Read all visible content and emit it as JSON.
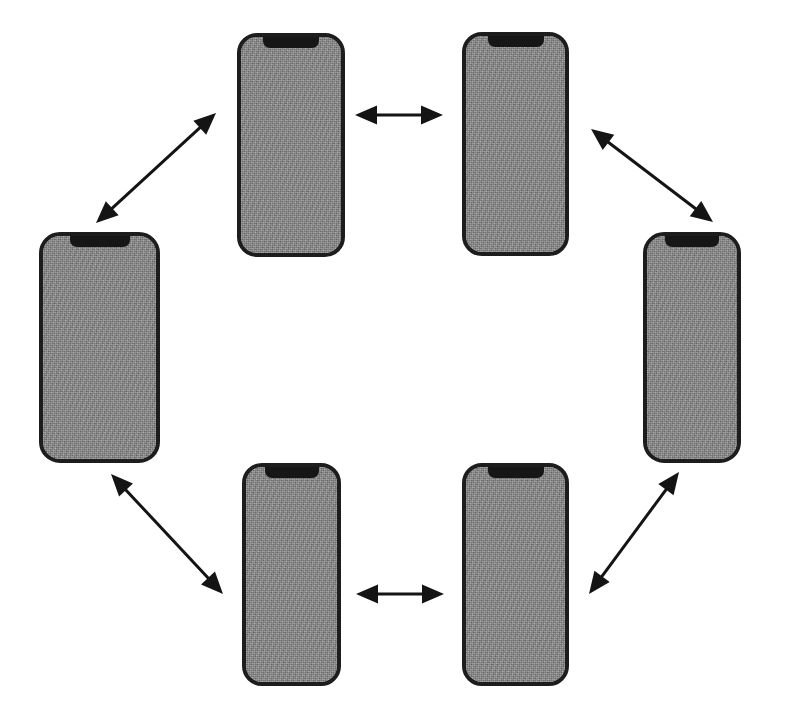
{
  "diagram": {
    "canvas": {
      "width": 791,
      "height": 722,
      "background": "#ffffff"
    },
    "style": {
      "device_bezel_color": "#1d1d1d",
      "device_screen_color": "#8a8a8a",
      "device_notch_color": "#161616",
      "arrow_color": "#141414"
    },
    "devices": [
      {
        "id": "device-top-left",
        "label": "smartphone-top-left",
        "x": 237,
        "y": 33,
        "width": 108,
        "height": 224,
        "bezel": 4,
        "radius": 20,
        "notch": {
          "width": 56,
          "height": 11
        }
      },
      {
        "id": "device-top-right",
        "label": "smartphone-top-right",
        "x": 462,
        "y": 32,
        "width": 107,
        "height": 224,
        "bezel": 4,
        "radius": 20,
        "notch": {
          "width": 56,
          "height": 11
        }
      },
      {
        "id": "device-left",
        "label": "smartphone-left",
        "x": 39,
        "y": 232,
        "width": 121,
        "height": 231,
        "bezel": 4,
        "radius": 21,
        "notch": {
          "width": 60,
          "height": 11
        }
      },
      {
        "id": "device-right",
        "label": "smartphone-right",
        "x": 643,
        "y": 232,
        "width": 98,
        "height": 231,
        "bezel": 4,
        "radius": 21,
        "notch": {
          "width": 54,
          "height": 11
        }
      },
      {
        "id": "device-bottom-left",
        "label": "smartphone-bottom-left",
        "x": 242,
        "y": 463,
        "width": 99,
        "height": 223,
        "bezel": 4,
        "radius": 20,
        "notch": {
          "width": 54,
          "height": 11
        }
      },
      {
        "id": "device-bottom-right",
        "label": "smartphone-bottom-right",
        "x": 462,
        "y": 463,
        "width": 107,
        "height": 223,
        "bezel": 4,
        "radius": 20,
        "notch": {
          "width": 56,
          "height": 11
        }
      }
    ],
    "connections": [
      {
        "id": "connection-top",
        "label": "top-left to top-right",
        "from": "device-top-left",
        "to": "device-top-right",
        "orientation": "horizontal",
        "bidirectional": true,
        "x1": 355,
        "y1": 115,
        "x2": 443,
        "y2": 115,
        "stroke_width": 3,
        "head_length": 22,
        "head_width": 19
      },
      {
        "id": "connection-upper-left",
        "label": "left to top-left",
        "from": "device-left",
        "to": "device-top-left",
        "orientation": "diagonal-up-right",
        "bidirectional": true,
        "x1": 96,
        "y1": 223,
        "x2": 216,
        "y2": 113,
        "stroke_width": 3,
        "head_length": 22,
        "head_width": 19
      },
      {
        "id": "connection-upper-right",
        "label": "top-right to right",
        "from": "device-top-right",
        "to": "device-right",
        "orientation": "diagonal-down-right",
        "bidirectional": true,
        "x1": 591,
        "y1": 129,
        "x2": 713,
        "y2": 222,
        "stroke_width": 3,
        "head_length": 22,
        "head_width": 19
      },
      {
        "id": "connection-lower-left",
        "label": "left to bottom-left",
        "from": "device-left",
        "to": "device-bottom-left",
        "orientation": "diagonal-down-right",
        "bidirectional": true,
        "x1": 111,
        "y1": 474,
        "x2": 223,
        "y2": 594,
        "stroke_width": 3,
        "head_length": 22,
        "head_width": 19
      },
      {
        "id": "connection-bottom",
        "label": "bottom-left to bottom-right",
        "from": "device-bottom-left",
        "to": "device-bottom-right",
        "orientation": "horizontal",
        "bidirectional": true,
        "x1": 356,
        "y1": 594,
        "x2": 444,
        "y2": 594,
        "stroke_width": 3,
        "head_length": 22,
        "head_width": 19
      },
      {
        "id": "connection-lower-right",
        "label": "bottom-right to right",
        "from": "device-bottom-right",
        "to": "device-right",
        "orientation": "diagonal-up-right",
        "bidirectional": true,
        "x1": 589,
        "y1": 594,
        "x2": 679,
        "y2": 472,
        "stroke_width": 3,
        "head_length": 22,
        "head_width": 19
      }
    ]
  }
}
